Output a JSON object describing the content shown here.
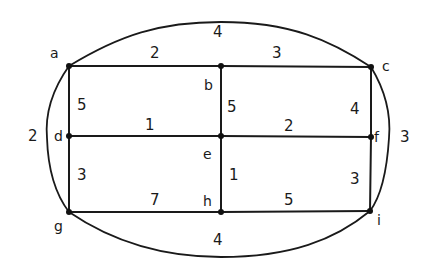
{
  "diagram": {
    "type": "weighted-undirected-graph",
    "nodes": [
      {
        "id": "a",
        "label": "a",
        "x": 69,
        "y": 66,
        "lx": 50,
        "ly": 58
      },
      {
        "id": "b",
        "label": "b",
        "x": 221,
        "y": 66,
        "lx": 204,
        "ly": 90
      },
      {
        "id": "c",
        "label": "c",
        "x": 371,
        "y": 67,
        "lx": 382,
        "ly": 71
      },
      {
        "id": "d",
        "label": "d",
        "x": 69,
        "y": 136,
        "lx": 54,
        "ly": 141
      },
      {
        "id": "e",
        "label": "e",
        "x": 221,
        "y": 136,
        "lx": 203,
        "ly": 159
      },
      {
        "id": "f",
        "label": "f",
        "x": 371,
        "y": 137,
        "lx": 374,
        "ly": 142
      },
      {
        "id": "g",
        "label": "g",
        "x": 69,
        "y": 212,
        "lx": 54,
        "ly": 231
      },
      {
        "id": "h",
        "label": "h",
        "x": 221,
        "y": 212,
        "lx": 203,
        "ly": 206
      },
      {
        "id": "i",
        "label": "i",
        "x": 370,
        "y": 211,
        "lx": 377,
        "ly": 225
      }
    ],
    "edges": [
      {
        "from": "a",
        "to": "b",
        "weight": "2",
        "wx": 150,
        "wy": 58
      },
      {
        "from": "b",
        "to": "c",
        "weight": "3",
        "wx": 272,
        "wy": 58
      },
      {
        "from": "a",
        "to": "d",
        "weight": "5",
        "wx": 77,
        "wy": 110
      },
      {
        "from": "b",
        "to": "e",
        "weight": "5",
        "wx": 227,
        "wy": 112
      },
      {
        "from": "c",
        "to": "f",
        "weight": "4",
        "wx": 350,
        "wy": 114
      },
      {
        "from": "d",
        "to": "e",
        "weight": "1",
        "wx": 145,
        "wy": 130
      },
      {
        "from": "e",
        "to": "f",
        "weight": "2",
        "wx": 284,
        "wy": 131
      },
      {
        "from": "d",
        "to": "g",
        "weight": "3",
        "wx": 77,
        "wy": 180
      },
      {
        "from": "e",
        "to": "h",
        "weight": "1",
        "wx": 229,
        "wy": 180
      },
      {
        "from": "f",
        "to": "i",
        "weight": "3",
        "wx": 350,
        "wy": 184
      },
      {
        "from": "g",
        "to": "h",
        "weight": "7",
        "wx": 150,
        "wy": 205
      },
      {
        "from": "h",
        "to": "i",
        "weight": "5",
        "wx": 284,
        "wy": 205
      }
    ],
    "arcs": [
      {
        "from": "a",
        "to": "c",
        "weight": "4",
        "wx": 213,
        "wy": 37,
        "path": "M69,66 C120,35 160,22 221,22 C290,22 330,40 371,67"
      },
      {
        "from": "a",
        "to": "g",
        "weight": "2",
        "wx": 28,
        "wy": 141,
        "path": "M69,66 C52,90 45,115 47,138 C48,170 56,195 69,212"
      },
      {
        "from": "c",
        "to": "i",
        "weight": "3",
        "wx": 400,
        "wy": 142,
        "path": "M371,67 C385,90 391,115 389,138 C387,170 382,195 370,211"
      },
      {
        "from": "g",
        "to": "i",
        "weight": "4",
        "wx": 213,
        "wy": 245,
        "path": "M69,212 C110,240 160,257 221,257 C290,257 335,240 370,211"
      }
    ]
  }
}
